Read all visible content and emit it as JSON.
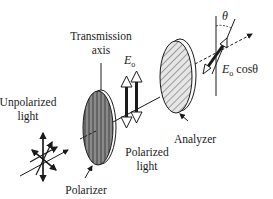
{
  "diagram": {
    "labels": {
      "transmission_axis_line1": "Transmission",
      "transmission_axis_line2": "axis",
      "unpolarized_line1": "Unpolarized",
      "unpolarized_line2": "light",
      "polarizer": "Polarizer",
      "polarized_line1": "Polarized",
      "polarized_line2": "light",
      "analyzer": "Analyzer",
      "e0_symbol": "E",
      "e0_subscript": "o",
      "e0cos_symbol": "E",
      "e0cos_subscript": "o",
      "e0cos_suffix": " cosθ",
      "theta": "θ"
    },
    "colors": {
      "ink": "#1a1a1a",
      "polarizer_fill": "#8a8a8a",
      "analyzer_fill": "#d8d8d8",
      "arrow_fill": "#ffffff"
    }
  }
}
